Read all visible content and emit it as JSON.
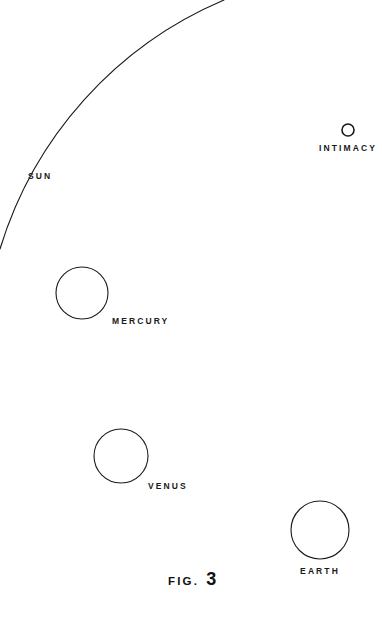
{
  "figure": {
    "caption_word": "FIG.",
    "caption_number": "3",
    "background_color": "#ffffff",
    "stroke_color": "#1a1a1a",
    "text_color": "#1a1a1a"
  },
  "labels": {
    "sun": "SUN",
    "intimacy": "INTIMACY",
    "mercury": "MERCURY",
    "venus": "VENUS",
    "earth": "EARTH"
  },
  "diagram": {
    "type": "line-drawing",
    "sun_arc": {
      "label": "SUN",
      "start": [
        224,
        0
      ],
      "end": [
        0,
        249
      ],
      "center": [
        -165,
        -50
      ],
      "radius": 395,
      "stroke_width": 1.1
    },
    "bodies": [
      {
        "name": "INTIMACY",
        "cx": 348,
        "cy": 130,
        "r": 6,
        "stroke_width": 1.6
      },
      {
        "name": "MERCURY",
        "cx": 82,
        "cy": 293,
        "r": 26,
        "stroke_width": 1.1
      },
      {
        "name": "VENUS",
        "cx": 121,
        "cy": 456,
        "r": 27,
        "stroke_width": 1.1
      },
      {
        "name": "EARTH",
        "cx": 320,
        "cy": 530,
        "r": 29,
        "stroke_width": 1.1
      }
    ]
  }
}
